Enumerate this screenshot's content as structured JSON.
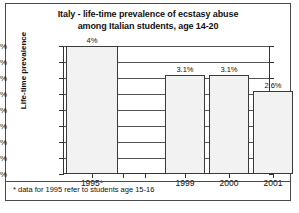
{
  "chart_data": {
    "type": "bar",
    "title": "Italy - life-time prevalence of ecstasy abuse among Italian students, age 14-20",
    "title_lines": [
      "Italy - life-time prevalence of ecstasy abuse",
      "among Italian students, age 14-20"
    ],
    "xlabel": "",
    "ylabel": "Life-time prevalence",
    "categories": [
      "1995*",
      "1999",
      "2000",
      "2001"
    ],
    "values": [
      4.0,
      3.1,
      3.1,
      2.6
    ],
    "data_labels": [
      "4%",
      "3.1%",
      "3.1%",
      "2.6%"
    ],
    "ylim": [
      0.0,
      4.0
    ],
    "ytick_values": [
      0.0,
      0.5,
      1.0,
      1.5,
      2.0,
      2.5,
      3.0,
      3.5,
      4.0
    ],
    "ytick_labels": [
      "0.0%",
      "0.5%",
      "1.0%",
      "1.5%",
      "2.0%",
      "2.5%",
      "3.0%",
      "3.5%",
      "4.0%"
    ],
    "grid": true,
    "legend": false,
    "bar_fill_color": "#f2f2f2",
    "bar_border_color": "#3a3a3a",
    "gridline_color": "#555555",
    "axis_color": "#333333"
  },
  "footnote": "* data for 1995 refer to students age 15-16"
}
